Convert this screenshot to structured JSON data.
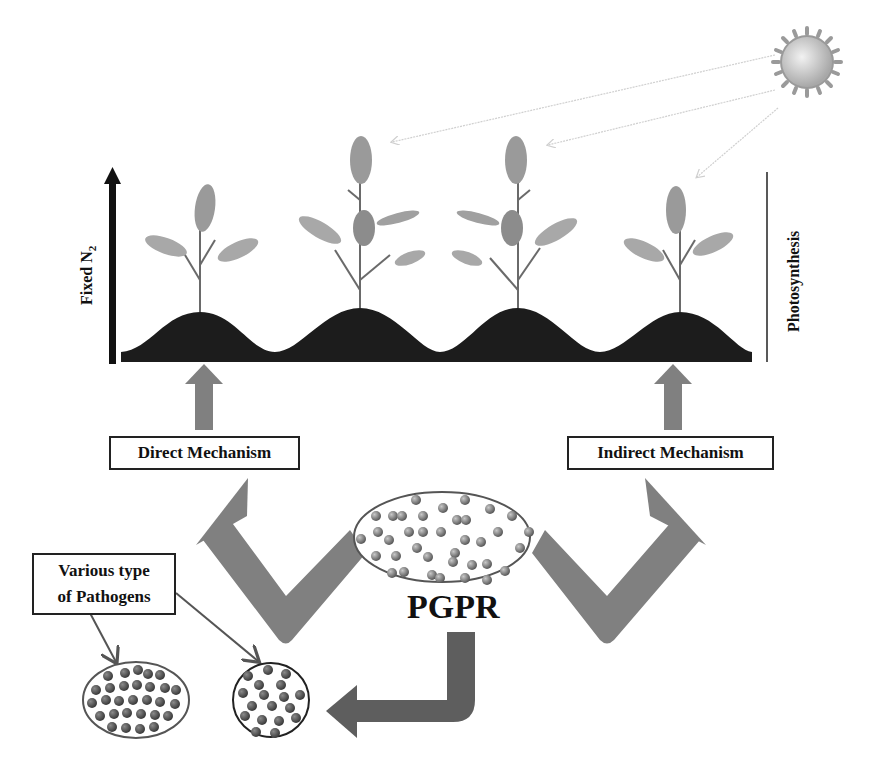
{
  "diagram": {
    "title_axis_left": {
      "text": "Fixed N",
      "subscript": "2"
    },
    "title_axis_right": "Photosynthesis",
    "boxes": {
      "direct": "Direct Mechanism",
      "indirect": "Indirect Mechanism",
      "pathogens_line1": "Various type",
      "pathogens_line2": "of Pathogens"
    },
    "center_label": "PGPR",
    "icons": [
      "sun-icon",
      "plant-icon",
      "soil-mound",
      "bacteria-cluster",
      "pathogen-cluster"
    ],
    "colors": {
      "arrow_gray": "#808080",
      "dark_arrow": "#5a5a5a",
      "soil": "#1a1a1a",
      "leaf": "#9a9a9a",
      "bacteria": "#7a7a7a",
      "pathogen": "#555555"
    }
  }
}
